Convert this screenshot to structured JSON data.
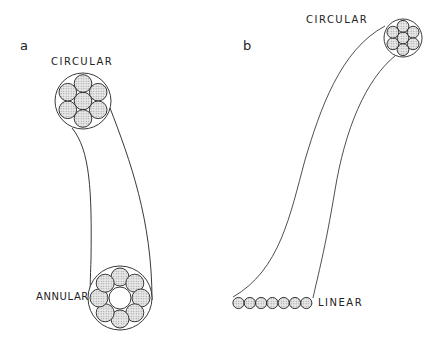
{
  "panels": [
    {
      "id": "a",
      "label": "a",
      "top_label": "CIRCULAR",
      "bottom_label": "ANNULAR",
      "top_arrangement": "circular: 1 center fiber + 6 surrounding fibers",
      "bottom_arrangement": "annular: 8 fibers in a ring with hollow center"
    },
    {
      "id": "b",
      "label": "b",
      "top_label": "CIRCULAR",
      "bottom_label": "LINEAR",
      "top_arrangement": "circular: 1 center fiber + 6 surrounding fibers",
      "bottom_arrangement": "linear: 7 fibers in a row"
    }
  ],
  "colors": {
    "line": "#222222",
    "fiber_fill": "#d6d6d6",
    "background": "#ffffff"
  }
}
